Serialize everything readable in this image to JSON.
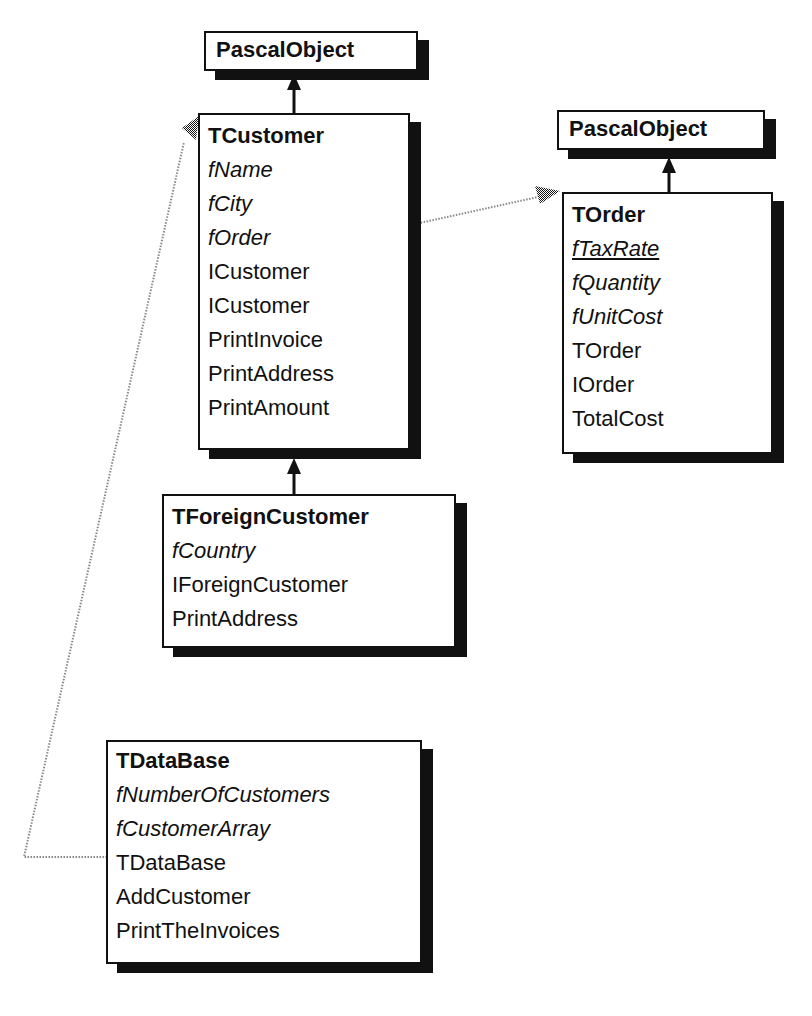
{
  "diagram": {
    "type": "class-hierarchy",
    "notation": {
      "title": "bold = class name",
      "fields": "italic = field",
      "class_fields": "italic underlined = class variable",
      "methods": "plain = method",
      "solid_arrow": "inheritance",
      "dotted_arrow": "reference"
    }
  },
  "classes": {
    "pascal_object_1": {
      "name": "PascalObject"
    },
    "tcustomer": {
      "name": "TCustomer",
      "fields": [
        "fName",
        "fCity",
        "fOrder"
      ],
      "methods": [
        "ICustomer",
        "ICustomer",
        "PrintInvoice",
        "PrintAddress",
        "PrintAmount"
      ]
    },
    "pascal_object_2": {
      "name": "PascalObject"
    },
    "torder": {
      "name": "TOrder",
      "class_fields": [
        "fTaxRate"
      ],
      "fields": [
        "fQuantity",
        "fUnitCost"
      ],
      "methods": [
        "TOrder",
        "IOrder",
        "TotalCost"
      ]
    },
    "tforeigncustomer": {
      "name": "TForeignCustomer",
      "fields": [
        "fCountry"
      ],
      "methods": [
        "IForeignCustomer",
        "PrintAddress"
      ]
    },
    "tdatabase": {
      "name": "TDataBase",
      "fields": [
        "fNumberOfCustomers",
        "fCustomerArray"
      ],
      "methods": [
        "TDataBase",
        "AddCustomer",
        "PrintTheInvoices"
      ]
    }
  },
  "edges": [
    {
      "from": "TCustomer",
      "to": "PascalObject",
      "kind": "inheritance"
    },
    {
      "from": "TOrder",
      "to": "PascalObject",
      "kind": "inheritance"
    },
    {
      "from": "TForeignCustomer",
      "to": "TCustomer",
      "kind": "inheritance"
    },
    {
      "from": "TCustomer.fOrder",
      "to": "TOrder",
      "kind": "reference"
    },
    {
      "from": "TDataBase.fCustomerArray",
      "to": "TCustomer",
      "kind": "reference"
    }
  ],
  "colors": {
    "ink": "#111111",
    "background": "#ffffff",
    "reference_line": "#8a8a8a"
  }
}
